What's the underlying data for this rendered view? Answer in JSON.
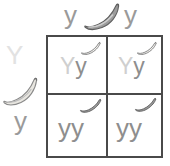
{
  "diagram": {
    "type": "punnett-square",
    "title": "",
    "parents": {
      "top": {
        "alleles": [
          "y",
          "y"
        ],
        "phenotype_icon": "banana-icon",
        "icon_shade": "dark"
      },
      "left": {
        "alleles": [
          "Y",
          "y"
        ],
        "phenotype_icon": "banana-icon",
        "icon_shade": "light"
      }
    },
    "cells": [
      {
        "position": "top-left",
        "alleles": [
          "Y",
          "y"
        ],
        "genotype": "Yy",
        "icon": "banana-icon",
        "icon_shade": "light"
      },
      {
        "position": "top-right",
        "alleles": [
          "Y",
          "y"
        ],
        "genotype": "Yy",
        "icon": "banana-icon",
        "icon_shade": "light"
      },
      {
        "position": "bottom-left",
        "alleles": [
          "y",
          "y"
        ],
        "genotype": "yy",
        "icon": "banana-icon",
        "icon_shade": "dark"
      },
      {
        "position": "bottom-right",
        "alleles": [
          "y",
          "y"
        ],
        "genotype": "yy",
        "icon": "banana-icon",
        "icon_shade": "dark"
      }
    ],
    "colors": {
      "grid_line": "#4a4a4a",
      "allele_dominant_faint": "#cfcfcf",
      "allele_recessive": "#8e8e8e",
      "parent_label": "#9a9a9a",
      "parent_label_faint": "#e2e2e2",
      "banana_dark_fill": "#9b9b9b",
      "banana_light_fill": "#e6e4de",
      "banana_outline": "#6e6e6e",
      "background": "#ffffff"
    }
  }
}
